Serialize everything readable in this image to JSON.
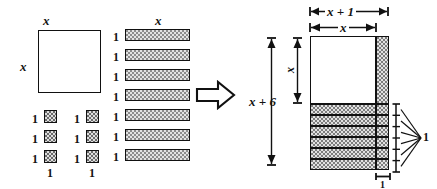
{
  "figure": {
    "arrow_icon": "right-block-arrow-icon"
  },
  "left_group": {
    "x_square": {
      "top_label": "x",
      "left_label": "x",
      "fill": "white",
      "count": 1
    },
    "unit_squares": {
      "rows": 3,
      "cols": 2,
      "count": 6,
      "side_label": "1",
      "bottom_label": "1",
      "row_labels": [
        "1",
        "1",
        "1"
      ],
      "bottom_labels": [
        "1",
        "1"
      ]
    },
    "x_strips": {
      "count": 7,
      "top_label": "x",
      "side_labels": [
        "1",
        "1",
        "1",
        "1",
        "1",
        "1",
        "1"
      ]
    }
  },
  "right_group": {
    "top_dimension_outer": "x + 1",
    "top_dimension_inner": "x",
    "left_dimension_outer": "x + 6",
    "left_dimension_inner": "x",
    "bottom_dimension": "1",
    "right_brace_label": "1",
    "rows_of_unit_height": 6,
    "x_square_fill": "white",
    "strip_fill": "dotted-gray"
  },
  "colors": {
    "ink": "#111111",
    "tile_fill": "#e2e2e2",
    "tile_dot": "#7d7d7d",
    "background": "#ffffff"
  }
}
